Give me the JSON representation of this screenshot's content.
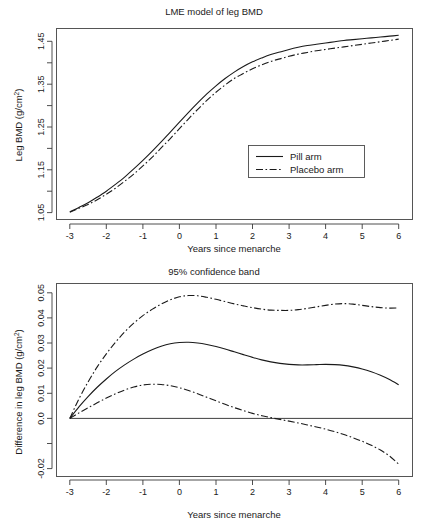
{
  "figure": {
    "width": 428,
    "height": 530,
    "background": "#ffffff",
    "ink_color": "#1a1a1a"
  },
  "chart_data": [
    {
      "id": "lme-model-leg-bmd",
      "type": "line",
      "title": "LME model of leg BMD",
      "xlabel": "Years since menarche",
      "ylabel": "Leg BMD (g/cm2)",
      "ylabel_base": "Leg BMD (g/cm",
      "ylabel_sup": "2",
      "ylabel_close": ")",
      "xlim": [
        -3.35,
        6.35
      ],
      "ylim": [
        1.028,
        1.482
      ],
      "xticks": [
        -3,
        -2,
        -1,
        0,
        1,
        2,
        3,
        4,
        5,
        6
      ],
      "xticklabels": [
        "-3",
        "-2",
        "-1",
        "0",
        "1",
        "2",
        "3",
        "4",
        "5",
        "6"
      ],
      "yticks": [
        1.05,
        1.1,
        1.15,
        1.2,
        1.25,
        1.3,
        1.35,
        1.4,
        1.45
      ],
      "yticklabels": [
        "1.05",
        "",
        "1.15",
        "",
        "1.25",
        "",
        "1.35",
        "",
        "1.45"
      ],
      "grid": false,
      "legend_position": "center-right",
      "legend": [
        {
          "label": "Pill arm",
          "style": "solid"
        },
        {
          "label": "Placebo arm",
          "style": "dashdot"
        }
      ],
      "series": [
        {
          "name": "Pill arm",
          "style": "solid",
          "x": [
            -3.0,
            -2.75,
            -2.5,
            -2.25,
            -2.0,
            -1.75,
            -1.5,
            -1.25,
            -1.0,
            -0.75,
            -0.5,
            -0.25,
            0.0,
            0.25,
            0.5,
            0.75,
            1.0,
            1.25,
            1.5,
            1.75,
            2.0,
            2.25,
            2.5,
            2.75,
            3.0,
            3.25,
            3.5,
            3.75,
            4.0,
            4.25,
            4.5,
            4.75,
            5.0,
            5.25,
            5.5,
            5.75,
            6.0
          ],
          "y": [
            1.052,
            1.062,
            1.073,
            1.086,
            1.1,
            1.116,
            1.133,
            1.152,
            1.172,
            1.193,
            1.215,
            1.238,
            1.261,
            1.284,
            1.306,
            1.327,
            1.346,
            1.363,
            1.378,
            1.391,
            1.402,
            1.411,
            1.419,
            1.425,
            1.431,
            1.436,
            1.44,
            1.443,
            1.446,
            1.449,
            1.452,
            1.454,
            1.456,
            1.458,
            1.46,
            1.462,
            1.464
          ]
        },
        {
          "name": "Placebo arm",
          "style": "dashdot",
          "x": [
            -3.0,
            -2.75,
            -2.5,
            -2.25,
            -2.0,
            -1.75,
            -1.5,
            -1.25,
            -1.0,
            -0.75,
            -0.5,
            -0.25,
            0.0,
            0.25,
            0.5,
            0.75,
            1.0,
            1.25,
            1.5,
            1.75,
            2.0,
            2.25,
            2.5,
            2.75,
            3.0,
            3.25,
            3.5,
            3.75,
            4.0,
            4.25,
            4.5,
            4.75,
            5.0,
            5.25,
            5.5,
            5.75,
            6.0
          ],
          "y": [
            1.051,
            1.06,
            1.069,
            1.08,
            1.093,
            1.107,
            1.123,
            1.14,
            1.159,
            1.179,
            1.201,
            1.223,
            1.246,
            1.269,
            1.291,
            1.312,
            1.331,
            1.348,
            1.363,
            1.375,
            1.386,
            1.395,
            1.403,
            1.409,
            1.415,
            1.42,
            1.424,
            1.428,
            1.431,
            1.434,
            1.437,
            1.44,
            1.443,
            1.446,
            1.449,
            1.452,
            1.455
          ]
        }
      ]
    },
    {
      "id": "confidence-band",
      "type": "line",
      "title": "95% confidence band",
      "xlabel": "Years since menarche",
      "ylabel": "Difference in leg BMD (g/cm2)",
      "ylabel_base": "Difference in leg BMD (g/cm",
      "ylabel_sup": "2",
      "ylabel_close": ")",
      "xlim": [
        -3.35,
        6.35
      ],
      "ylim": [
        -0.0225,
        0.0525
      ],
      "xticks": [
        -3,
        -2,
        -1,
        0,
        1,
        2,
        3,
        4,
        5,
        6
      ],
      "xticklabels": [
        "-3",
        "-2",
        "-1",
        "0",
        "1",
        "2",
        "3",
        "4",
        "5",
        "6"
      ],
      "yticks": [
        -0.02,
        -0.01,
        0.0,
        0.01,
        0.02,
        0.03,
        0.04,
        0.05
      ],
      "yticklabels": [
        "-0.02",
        "",
        "0.0",
        "0.01",
        "0.02",
        "0.03",
        "0.04",
        "0.05"
      ],
      "grid": false,
      "reference_line": {
        "y": 0.0,
        "style": "solid",
        "label": "zero-reference"
      },
      "series": [
        {
          "name": "Upper 95% bound",
          "style": "dashdot",
          "x": [
            -3.0,
            -2.75,
            -2.5,
            -2.25,
            -2.0,
            -1.75,
            -1.5,
            -1.25,
            -1.0,
            -0.75,
            -0.5,
            -0.25,
            0.0,
            0.25,
            0.5,
            0.75,
            1.0,
            1.25,
            1.5,
            1.75,
            2.0,
            2.25,
            2.5,
            2.75,
            3.0,
            3.25,
            3.5,
            3.75,
            4.0,
            4.25,
            4.5,
            4.75,
            5.0,
            5.25,
            5.5,
            5.75,
            6.0
          ],
          "y": [
            0.0,
            0.0078,
            0.0145,
            0.0205,
            0.0257,
            0.0303,
            0.0344,
            0.0379,
            0.0409,
            0.0434,
            0.0455,
            0.0472,
            0.0484,
            0.0489,
            0.0488,
            0.0482,
            0.0474,
            0.0465,
            0.0456,
            0.0448,
            0.0441,
            0.0435,
            0.0431,
            0.043,
            0.043,
            0.0433,
            0.0438,
            0.0444,
            0.045,
            0.0455,
            0.0457,
            0.0455,
            0.045,
            0.0445,
            0.0441,
            0.0439,
            0.044
          ]
        },
        {
          "name": "Estimated difference",
          "style": "solid",
          "x": [
            -3.0,
            -2.75,
            -2.5,
            -2.25,
            -2.0,
            -1.75,
            -1.5,
            -1.25,
            -1.0,
            -0.75,
            -0.5,
            -0.25,
            0.0,
            0.25,
            0.5,
            0.75,
            1.0,
            1.25,
            1.5,
            1.75,
            2.0,
            2.25,
            2.5,
            2.75,
            3.0,
            3.25,
            3.5,
            3.75,
            4.0,
            4.25,
            4.5,
            4.75,
            5.0,
            5.25,
            5.5,
            5.75,
            6.0
          ],
          "y": [
            0.0,
            0.0046,
            0.0087,
            0.0124,
            0.0157,
            0.0187,
            0.0213,
            0.0236,
            0.0256,
            0.0273,
            0.0287,
            0.0297,
            0.0302,
            0.0303,
            0.03,
            0.0294,
            0.0286,
            0.0276,
            0.0265,
            0.0254,
            0.0243,
            0.0233,
            0.0225,
            0.0219,
            0.0215,
            0.0213,
            0.0213,
            0.0214,
            0.0215,
            0.0214,
            0.0211,
            0.0205,
            0.0197,
            0.0186,
            0.0172,
            0.0155,
            0.0134
          ]
        },
        {
          "name": "Lower 95% bound",
          "style": "dashdot",
          "x": [
            -3.0,
            -2.75,
            -2.5,
            -2.25,
            -2.0,
            -1.75,
            -1.5,
            -1.25,
            -1.0,
            -0.75,
            -0.5,
            -0.25,
            0.0,
            0.25,
            0.5,
            0.75,
            1.0,
            1.25,
            1.5,
            1.75,
            2.0,
            2.25,
            2.5,
            2.75,
            3.0,
            3.25,
            3.5,
            3.75,
            4.0,
            4.25,
            4.5,
            4.75,
            5.0,
            5.25,
            5.5,
            5.75,
            6.0
          ],
          "y": [
            0.0,
            0.0022,
            0.0042,
            0.0062,
            0.0081,
            0.0098,
            0.0113,
            0.0125,
            0.0133,
            0.0136,
            0.0135,
            0.013,
            0.0122,
            0.0111,
            0.0098,
            0.0084,
            0.007,
            0.0056,
            0.0043,
            0.0031,
            0.002,
            0.0011,
            0.0003,
            -0.0004,
            -0.0011,
            -0.0018,
            -0.0026,
            -0.0034,
            -0.0043,
            -0.0053,
            -0.0064,
            -0.0077,
            -0.0091,
            -0.0107,
            -0.0126,
            -0.015,
            -0.0182
          ]
        }
      ]
    }
  ]
}
